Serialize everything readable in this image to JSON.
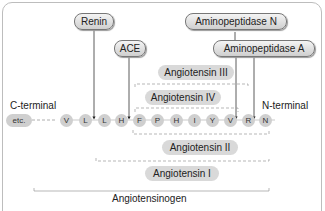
{
  "enzymes": {
    "renin": "Renin",
    "ace": "ACE",
    "aminopeptidase_n": "Aminopeptidase N",
    "aminopeptidase_a": "Aminopeptidase A"
  },
  "terminals": {
    "c": "C-terminal",
    "n": "N-terminal"
  },
  "residues": [
    "etc.",
    "V",
    "L",
    "L",
    "H",
    "F",
    "P",
    "H",
    "I",
    "Y",
    "V",
    "R",
    "N"
  ],
  "peptides": {
    "ang3": "Angiotensin III",
    "ang4": "Angiotensin IV",
    "ang2": "Angiotensin II",
    "ang1": "Angiotensin I",
    "angiotensinogen": "Angiotensinogen"
  }
}
